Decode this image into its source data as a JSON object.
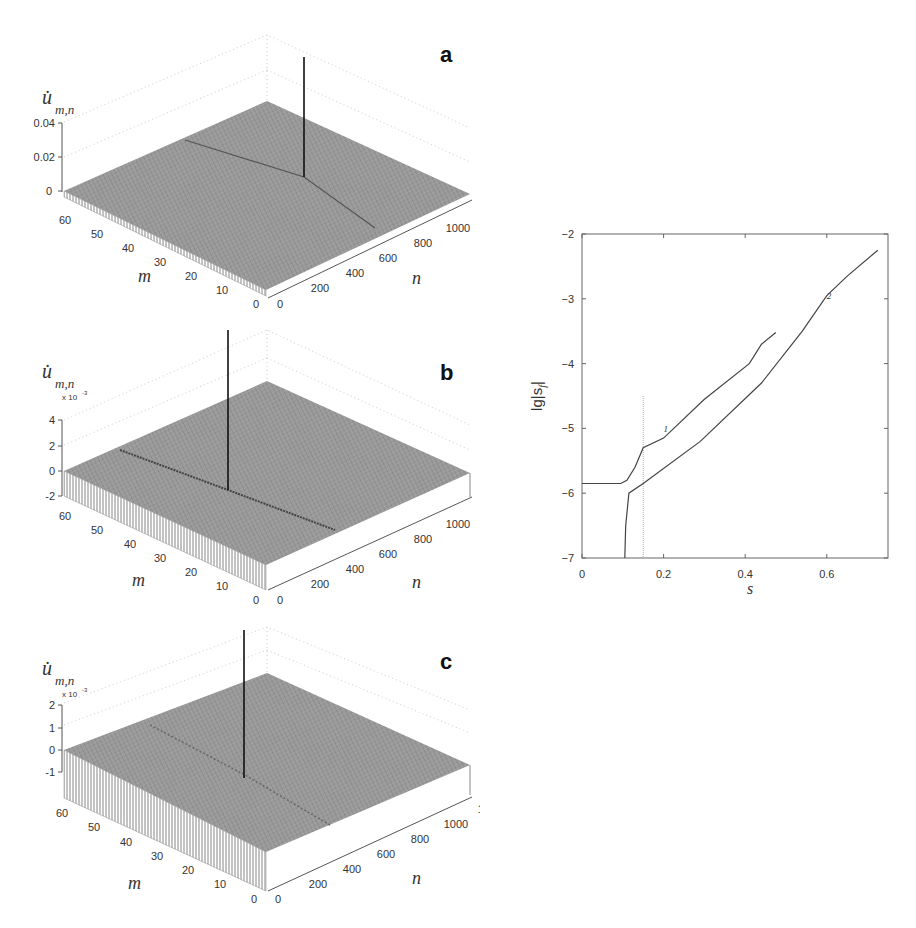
{
  "figure": {
    "panels_3d": [
      {
        "letter": "a",
        "zlabel_main": "u̇",
        "zlabel_sub": "m,n",
        "z_multiplier": "",
        "z_ticks": [
          "0.04",
          "0.02",
          "0"
        ],
        "m_label": "m",
        "n_label": "n",
        "m_ticks": [
          "60",
          "50",
          "40",
          "30",
          "20",
          "10",
          "0"
        ],
        "n_ticks": [
          "0",
          "200",
          "400",
          "600",
          "800",
          "1000",
          "1200"
        ]
      },
      {
        "letter": "b",
        "zlabel_main": "u̇",
        "zlabel_sub": "m,n",
        "z_multiplier": "x 10",
        "z_multiplier_exp": "-3",
        "z_ticks": [
          "4",
          "2",
          "0",
          "-2"
        ],
        "m_label": "m",
        "n_label": "n",
        "m_ticks": [
          "60",
          "50",
          "40",
          "30",
          "20",
          "10",
          "0"
        ],
        "n_ticks": [
          "0",
          "200",
          "400",
          "600",
          "800",
          "1000",
          "1200"
        ]
      },
      {
        "letter": "c",
        "zlabel_main": "u̇",
        "zlabel_sub": "m,n",
        "z_multiplier": "x 10",
        "z_multiplier_exp": "-3",
        "z_ticks": [
          "2",
          "1",
          "0",
          "-1"
        ],
        "m_label": "m",
        "n_label": "n",
        "m_ticks": [
          "60",
          "50",
          "40",
          "30",
          "20",
          "10",
          "0"
        ],
        "n_ticks": [
          "0",
          "200",
          "400",
          "600",
          "800",
          "1000",
          "1200"
        ]
      }
    ],
    "line_plot": {
      "ylabel": "lg|s",
      "ylabel_sub": "f",
      "ylabel_tail": "|",
      "xlabel": "s",
      "x_ticks": [
        "0",
        "0.2",
        "0.4",
        "0.6"
      ],
      "y_ticks": [
        "-2",
        "-3",
        "-4",
        "-5",
        "-6",
        "-7"
      ],
      "curve_labels": [
        "1",
        "2"
      ]
    }
  },
  "chart_data": [
    {
      "type": "surface3d",
      "panel": "a",
      "title": "a",
      "xlabel": "n",
      "ylabel": "m",
      "zlabel": "u̇_{m,n}",
      "xlim": [
        0,
        1200
      ],
      "ylim": [
        0,
        60
      ],
      "zlim": [
        0,
        0.04
      ],
      "x_ticks": [
        0,
        200,
        400,
        600,
        800,
        1000,
        1200
      ],
      "y_ticks": [
        0,
        10,
        20,
        30,
        40,
        50,
        60
      ],
      "z_ticks": [
        0,
        0.02,
        0.04
      ],
      "description": "Near-flat surface with a single sharp spike (~0.04+) near n≈1000, m≈35; V-shaped wake radiating from spike"
    },
    {
      "type": "surface3d",
      "panel": "b",
      "title": "b",
      "xlabel": "n",
      "ylabel": "m",
      "zlabel": "u̇_{m,n} (x 10^-3)",
      "xlim": [
        0,
        1200
      ],
      "ylim": [
        0,
        60
      ],
      "zlim": [
        -2,
        4
      ],
      "x_ticks": [
        0,
        200,
        400,
        600,
        800,
        1000,
        1200
      ],
      "y_ticks": [
        0,
        10,
        20,
        30,
        40,
        50,
        60
      ],
      "z_ticks": [
        -2,
        0,
        2,
        4
      ],
      "description": "Surface with a sharp spike near n≈600, m≈35 and an oscillating wake line along constant n"
    },
    {
      "type": "surface3d",
      "panel": "c",
      "title": "c",
      "xlabel": "n",
      "ylabel": "m",
      "zlabel": "u̇_{m,n} (x 10^-3)",
      "xlim": [
        0,
        1200
      ],
      "ylim": [
        0,
        60
      ],
      "zlim": [
        -1,
        2
      ],
      "x_ticks": [
        0,
        200,
        400,
        600,
        800,
        1000,
        1200
      ],
      "y_ticks": [
        0,
        10,
        20,
        30,
        40,
        50,
        60
      ],
      "z_ticks": [
        -1,
        0,
        1,
        2
      ],
      "description": "Surface with a sharp spike near n≈600, m≈35 and weaker oscillating wake"
    },
    {
      "type": "line",
      "title": "",
      "xlabel": "s",
      "ylabel": "lg|s_f|",
      "xlim": [
        0,
        0.75
      ],
      "ylim": [
        -7,
        -2
      ],
      "x_ticks": [
        0,
        0.2,
        0.4,
        0.6
      ],
      "y_ticks": [
        -7,
        -6,
        -5,
        -4,
        -3,
        -2
      ],
      "grid": false,
      "series": [
        {
          "name": "1",
          "x": [
            0.0,
            0.095,
            0.11,
            0.13,
            0.15,
            0.2,
            0.225,
            0.3,
            0.41,
            0.44,
            0.475
          ],
          "y": [
            -5.85,
            -5.85,
            -5.8,
            -5.6,
            -5.3,
            -5.15,
            -5.0,
            -4.55,
            -4.0,
            -3.7,
            -3.52
          ]
        },
        {
          "name": "2",
          "x": [
            0.105,
            0.107,
            0.115,
            0.15,
            0.29,
            0.44,
            0.54,
            0.6,
            0.65,
            0.725
          ],
          "y": [
            -7.0,
            -6.5,
            -6.0,
            -5.85,
            -5.2,
            -4.3,
            -3.5,
            -2.95,
            -2.65,
            -2.25
          ]
        }
      ],
      "annotations": [
        {
          "type": "vertical_dotted_line",
          "x": 0.15,
          "y_range": [
            -7,
            -4.5
          ]
        },
        {
          "text": "1",
          "x": 0.2,
          "y": -5.05
        },
        {
          "text": "2",
          "x": 0.6,
          "y": -3.0
        }
      ]
    }
  ]
}
